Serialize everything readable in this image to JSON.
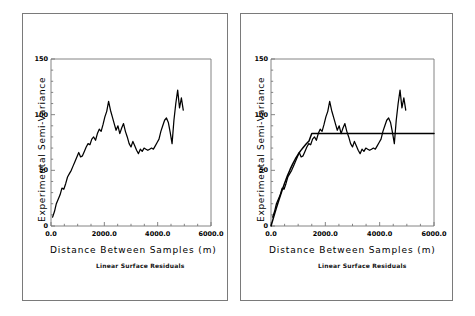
{
  "figure": {
    "panels": [
      {
        "id": "left",
        "caption": "Linear Surface Residuals",
        "has_model": false
      },
      {
        "id": "right",
        "caption": "Linear Surface Residuals",
        "has_model": true
      }
    ]
  },
  "chart_data": [
    {
      "type": "line",
      "title": "",
      "subtitle": "Linear Surface Residuals",
      "xlabel": "Distance Between Samples (m)",
      "ylabel": "Experimental Semi-Variance",
      "xlim": [
        0,
        6000
      ],
      "ylim": [
        0,
        150
      ],
      "xticks": [
        0,
        2000,
        4000,
        6000
      ],
      "xticklabels": [
        "0.0",
        "2000.0",
        "4000.0",
        "6000.0"
      ],
      "yticks": [
        0,
        50,
        100,
        150
      ],
      "yticklabels": [
        "0",
        "50",
        "100",
        "150"
      ],
      "grid": false,
      "legend": "none",
      "series": [
        {
          "name": "experimental semi-variogram",
          "x": [
            60,
            130,
            200,
            270,
            340,
            410,
            480,
            550,
            620,
            690,
            760,
            830,
            900,
            970,
            1040,
            1110,
            1180,
            1250,
            1320,
            1390,
            1460,
            1530,
            1600,
            1670,
            1740,
            1810,
            1880,
            1950,
            2020,
            2090,
            2160,
            2230,
            2300,
            2370,
            2440,
            2510,
            2580,
            2650,
            2720,
            2790,
            2860,
            2930,
            3000,
            3070,
            3140,
            3210,
            3280,
            3350,
            3420,
            3490,
            3560,
            3630,
            3700,
            3770,
            3840,
            3910,
            3980,
            4050,
            4120,
            4190,
            4260,
            4330,
            4400,
            4470,
            4540,
            4610,
            4680,
            4750,
            4820,
            4890,
            4960
          ],
          "y": [
            8,
            13,
            20,
            24,
            28,
            34,
            33,
            38,
            44,
            47,
            50,
            54,
            58,
            62,
            66,
            62,
            63,
            67,
            71,
            74,
            73,
            78,
            80,
            77,
            83,
            87,
            85,
            91,
            98,
            103,
            112,
            104,
            98,
            92,
            86,
            90,
            83,
            88,
            92,
            85,
            80,
            74,
            71,
            76,
            72,
            68,
            65,
            69,
            67,
            70,
            69,
            68,
            69,
            70,
            69,
            72,
            75,
            78,
            85,
            90,
            95,
            97,
            93,
            84,
            74,
            95,
            110,
            122,
            106,
            115,
            104
          ]
        }
      ]
    },
    {
      "type": "line",
      "title": "",
      "subtitle": "Linear Surface Residuals",
      "xlabel": "Distance Between Samples (m)",
      "ylabel": "Experimental Semi-Variance",
      "xlim": [
        0,
        6000
      ],
      "ylim": [
        0,
        150
      ],
      "xticks": [
        0,
        2000,
        4000,
        6000
      ],
      "xticklabels": [
        "0.0",
        "2000.0",
        "4000.0",
        "6000.0"
      ],
      "yticks": [
        0,
        50,
        100,
        150
      ],
      "yticklabels": [
        "0",
        "50",
        "100",
        "150"
      ],
      "grid": false,
      "legend": "none",
      "model": {
        "name": "fitted spherical model",
        "nugget": 0,
        "sill": 83,
        "range": 1500,
        "x": [
          0,
          100,
          200,
          300,
          400,
          500,
          600,
          700,
          800,
          900,
          1000,
          1100,
          1200,
          1300,
          1400,
          1500,
          2000,
          2500,
          3000,
          3500,
          4000,
          4500,
          5000,
          5500,
          6000
        ],
        "y": [
          0,
          8.2,
          16.3,
          24.1,
          31.5,
          38.4,
          44.8,
          50.6,
          55.8,
          60.4,
          64.4,
          67.9,
          71.0,
          73.8,
          76.4,
          83,
          83,
          83,
          83,
          83,
          83,
          83,
          83,
          83,
          83
        ]
      },
      "series": [
        {
          "name": "experimental semi-variogram",
          "x": [
            60,
            130,
            200,
            270,
            340,
            410,
            480,
            550,
            620,
            690,
            760,
            830,
            900,
            970,
            1040,
            1110,
            1180,
            1250,
            1320,
            1390,
            1460,
            1530,
            1600,
            1670,
            1740,
            1810,
            1880,
            1950,
            2020,
            2090,
            2160,
            2230,
            2300,
            2370,
            2440,
            2510,
            2580,
            2650,
            2720,
            2790,
            2860,
            2930,
            3000,
            3070,
            3140,
            3210,
            3280,
            3350,
            3420,
            3490,
            3560,
            3630,
            3700,
            3770,
            3840,
            3910,
            3980,
            4050,
            4120,
            4190,
            4260,
            4330,
            4400,
            4470,
            4540,
            4610,
            4680,
            4750,
            4820,
            4890,
            4960
          ],
          "y": [
            8,
            13,
            20,
            24,
            28,
            34,
            33,
            38,
            44,
            47,
            50,
            54,
            58,
            62,
            66,
            62,
            63,
            67,
            71,
            74,
            73,
            78,
            80,
            77,
            83,
            87,
            85,
            91,
            98,
            103,
            112,
            104,
            98,
            92,
            86,
            90,
            83,
            88,
            92,
            85,
            80,
            74,
            71,
            76,
            72,
            68,
            65,
            69,
            67,
            70,
            69,
            68,
            69,
            70,
            69,
            72,
            75,
            78,
            85,
            90,
            95,
            97,
            93,
            84,
            74,
            95,
            110,
            122,
            106,
            115,
            104
          ]
        }
      ]
    }
  ]
}
